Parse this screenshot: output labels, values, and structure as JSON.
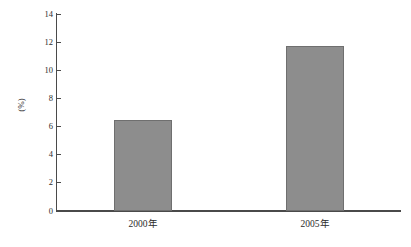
{
  "chart_data": {
    "type": "bar",
    "title": "",
    "subtitle": "",
    "xlabel": "",
    "ylabel": "(%)",
    "categories": [
      "2000年",
      "2005年"
    ],
    "values": [
      6.5,
      11.7
    ],
    "series": [
      {
        "name": "",
        "values": [
          6.5,
          11.7
        ]
      }
    ],
    "ylim": [
      0,
      14
    ],
    "yticks": [
      0,
      2,
      4,
      6,
      8,
      10,
      12,
      14
    ],
    "ytick_labels": [
      "0",
      "2",
      "4",
      "6",
      "8",
      "10",
      "12",
      "14"
    ],
    "grid": false,
    "legend": false,
    "legend_position": "none",
    "bar_color": "#8d8d8d",
    "bar_edge_color": "#6f6f6f",
    "axis_color": "#4a4a4a",
    "background_color": "#ffffff",
    "annotations": []
  },
  "axis": {
    "y_title": "(%)"
  }
}
